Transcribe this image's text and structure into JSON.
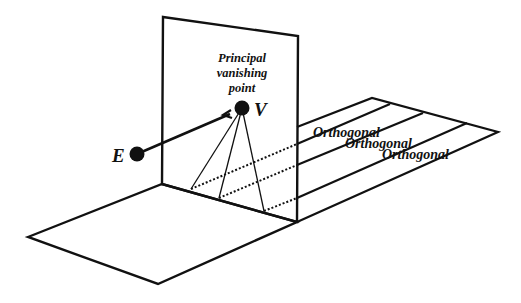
{
  "diagram": {
    "colors": {
      "ink": "#111111",
      "background": "#ffffff"
    },
    "labels": {
      "principal_line1": "Principal",
      "principal_line2": "vanishing",
      "principal_line3": "point",
      "eye": "E",
      "vanishing": "V",
      "orthogonals": [
        "Orthogonal",
        "Orthogonal",
        "Orthogonal"
      ]
    },
    "points": {
      "E": [
        137,
        154
      ],
      "V": [
        242,
        108
      ]
    },
    "picture_plane": {
      "corners": [
        [
          163,
          17
        ],
        [
          298,
          36
        ],
        [
          297,
          222
        ],
        [
          162,
          184
        ]
      ]
    },
    "ground_front": {
      "corners": [
        [
          28,
          237
        ],
        [
          162,
          184
        ],
        [
          297,
          222
        ],
        [
          158,
          284
        ]
      ]
    },
    "ground_back": {
      "corners": [
        [
          297,
          127
        ],
        [
          372,
          98
        ],
        [
          498,
          132
        ],
        [
          297,
          222
        ]
      ]
    },
    "visual_rays": [
      [
        191,
        189
      ],
      [
        219,
        198
      ],
      [
        264,
        211
      ]
    ],
    "orthogonal_lines": [
      {
        "start": [
          297,
          144
        ],
        "end": [
          390,
          104
        ]
      },
      {
        "start": [
          297,
          165
        ],
        "end": [
          423,
          113
        ]
      },
      {
        "start": [
          297,
          198
        ],
        "end": [
          467,
          123
        ]
      }
    ]
  }
}
